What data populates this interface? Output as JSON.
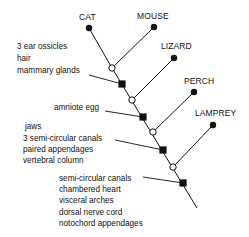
{
  "diagram": {
    "type": "cladogram",
    "taxa": [
      {
        "label": "CAT",
        "dot": [
          89,
          28
        ],
        "label_pos": [
          79,
          20
        ],
        "joins": [
          112,
          68
        ]
      },
      {
        "label": "MOUSE",
        "dot": [
          154,
          27
        ],
        "label_pos": [
          137,
          19
        ],
        "joins": [
          112,
          68
        ]
      },
      {
        "label": "LIZARD",
        "dot": [
          174,
          58
        ],
        "label_pos": [
          161,
          49
        ],
        "joins": [
          132,
          100
        ]
      },
      {
        "label": "PERCH",
        "dot": [
          194,
          92
        ],
        "label_pos": [
          184,
          84
        ],
        "joins": [
          153,
          132
        ]
      },
      {
        "label": "LAMPREY",
        "dot": [
          213,
          125
        ],
        "label_pos": [
          195,
          116
        ],
        "joins": [
          173,
          167
        ]
      }
    ],
    "nodes": [
      {
        "kind": "open",
        "pos": [
          112,
          68
        ]
      },
      {
        "kind": "filled",
        "pos": [
          122,
          84
        ]
      },
      {
        "kind": "open",
        "pos": [
          132,
          100
        ]
      },
      {
        "kind": "filled",
        "pos": [
          143,
          117
        ]
      },
      {
        "kind": "open",
        "pos": [
          153,
          132
        ]
      },
      {
        "kind": "filled",
        "pos": [
          163,
          150
        ]
      },
      {
        "kind": "open",
        "pos": [
          173,
          167
        ]
      },
      {
        "kind": "filled",
        "pos": [
          183,
          183
        ]
      }
    ],
    "trunk": {
      "top": [
        112,
        68
      ],
      "bottom": [
        197,
        208
      ]
    },
    "trait_groups": [
      {
        "lines": [
          "3 ear ossicles",
          "hair",
          "mammary glands"
        ],
        "text_pos": [
          17,
          49
        ],
        "line_height": 12,
        "leader_from": [
          89,
          75
        ],
        "leader_to": [
          122,
          84
        ]
      },
      {
        "lines": [
          "amniote egg"
        ],
        "text_pos": [
          54,
          110
        ],
        "line_height": 12,
        "leader_from": [
          105,
          111
        ],
        "leader_to": [
          143,
          117
        ]
      },
      {
        "lines": [
          "jaws"
        ],
        "text_pos": [
          25,
          129
        ],
        "line_height": 12,
        "leader_from": null,
        "leader_to": null
      },
      {
        "lines": [
          "3 semi-circular canals",
          "paired appendages",
          "vertebral column"
        ],
        "text_pos": [
          23,
          141
        ],
        "line_height": 11,
        "leader_from": [
          115,
          140
        ],
        "leader_to": [
          163,
          150
        ]
      },
      {
        "lines": [
          "semi-circular canals",
          "chambered heart",
          "visceral arches",
          "dorsal nerve cord",
          "notochord appendages"
        ],
        "text_pos": [
          59,
          181
        ],
        "line_height": 11.2,
        "leader_from": [
          143,
          177
        ],
        "leader_to": [
          183,
          183
        ]
      }
    ]
  }
}
